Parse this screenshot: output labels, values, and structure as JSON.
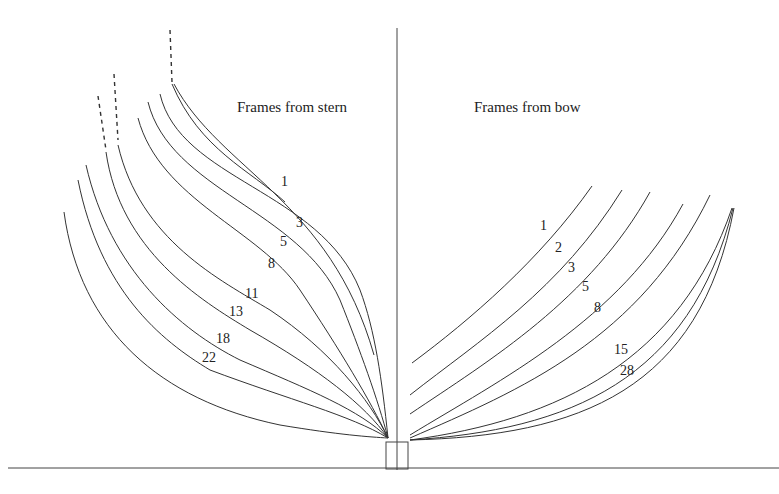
{
  "titles": {
    "stern": "Frames from stern",
    "bow": "Frames from bow"
  },
  "stern_labels": [
    "1",
    "3",
    "5",
    "8",
    "11",
    "13",
    "18",
    "22"
  ],
  "bow_labels": [
    "1",
    "2",
    "3",
    "5",
    "8",
    "15",
    "28"
  ],
  "colors": {
    "line": "#333333",
    "text": "#222222",
    "background": "#ffffff"
  }
}
